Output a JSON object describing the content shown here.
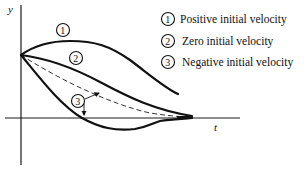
{
  "axes": {
    "y_label": "y",
    "x_label": "t"
  },
  "curves": [
    {
      "id": "1",
      "label": "1",
      "description": "Positive initial velocity"
    },
    {
      "id": "2",
      "label": "2",
      "description": "Zero initial velocity"
    },
    {
      "id": "3",
      "label": "3",
      "description": "Negative initial velocity"
    }
  ],
  "legend": {
    "items": [
      {
        "number": "1",
        "text": "Positive initial velocity"
      },
      {
        "number": "2",
        "text": "Zero initial velocity"
      },
      {
        "number": "3",
        "text": "Negative initial velocity"
      }
    ]
  },
  "colors": {
    "line": "#111111",
    "background": "#ffffff"
  }
}
